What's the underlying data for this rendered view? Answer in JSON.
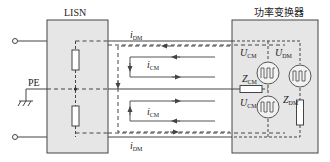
{
  "diagram": {
    "type": "circuit",
    "blocks": {
      "lisn": {
        "label": "LISN"
      },
      "converter": {
        "label": "功率变换器"
      }
    },
    "ground": {
      "label": "PE"
    },
    "currents": {
      "dm_top": {
        "symbol": "i",
        "sub": "DM"
      },
      "dm_bottom": {
        "symbol": "i",
        "sub": "DM"
      },
      "cm_top": {
        "symbol": "i",
        "sub": "CM"
      },
      "cm_bottom": {
        "symbol": "i",
        "sub": "CM"
      }
    },
    "components": {
      "ucm_top": {
        "symbol": "U",
        "sub": "CM"
      },
      "udm": {
        "symbol": "U",
        "sub": "DM"
      },
      "zcm": {
        "symbol": "Z",
        "sub": "CM"
      },
      "ucm_bottom": {
        "symbol": "U",
        "sub": "CM"
      },
      "zdm": {
        "symbol": "Z",
        "sub": "DM"
      }
    },
    "colors": {
      "box_fill": "#e6e6e6",
      "line": "#333333"
    }
  }
}
